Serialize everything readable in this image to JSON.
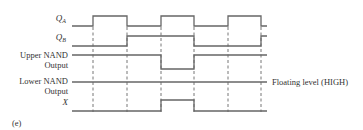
{
  "figure": {
    "caption": "(e)",
    "annotation": "Floating level (HIGH)",
    "colors": {
      "line": "#666666",
      "text": "#333333",
      "background": "#ffffff"
    }
  },
  "signals": [
    {
      "id": "qa",
      "label_main": "Q",
      "label_sub": "A",
      "waveform": "low, high, low, high, low"
    },
    {
      "id": "qb",
      "label_main": "Q",
      "label_sub": "B",
      "waveform": "low, low, high, low, high"
    },
    {
      "id": "upper_nand",
      "label_line1": "Upper NAND",
      "label_line2": "Output",
      "waveform": "high, high, high, low, high"
    },
    {
      "id": "lower_nand",
      "label_line1": "Lower NAND",
      "label_line2": "Output",
      "waveform": "high (floating) throughout"
    },
    {
      "id": "x",
      "label_main": "X",
      "waveform": "low, low, low, high, low"
    }
  ],
  "time_markers": [
    93,
    127,
    161,
    194,
    228,
    261
  ]
}
